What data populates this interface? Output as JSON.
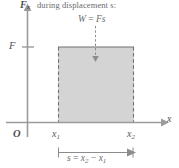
{
  "figure": {
    "caption": "during displacement s:",
    "work_label": {
      "lhs": "W",
      "eq": "=",
      "rhs": "Fs"
    },
    "y_axis": {
      "name": "F",
      "subscript": "x"
    },
    "x_axis": {
      "name": "x"
    },
    "origin_label": "O",
    "force_tick_label": "F",
    "x1_label": {
      "name": "x",
      "subscript": "1"
    },
    "x2_label": {
      "name": "x",
      "subscript": "2"
    },
    "displacement_eq": {
      "s": "s",
      "eq": "=",
      "term1_name": "x",
      "term1_sub": "2",
      "minus": "−",
      "term2_name": "x",
      "term2_sub": "1"
    },
    "colors": {
      "fill": "#d4d4d4",
      "line": "#6f7072",
      "text": "#58595b",
      "background": "#ffffff"
    }
  }
}
